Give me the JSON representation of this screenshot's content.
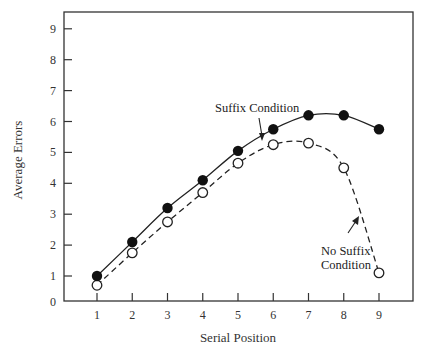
{
  "chart_data": {
    "type": "line",
    "title": "",
    "xlabel": "Serial Position",
    "ylabel": "Average Errors",
    "x": [
      1,
      2,
      3,
      4,
      5,
      6,
      7,
      8,
      9
    ],
    "xticks": [
      "1",
      "2",
      "3",
      "4",
      "5",
      "6",
      "7",
      "8",
      "9"
    ],
    "yticks": [
      "1",
      "2",
      "3",
      "4",
      "5",
      "6",
      "7",
      "8",
      "9"
    ],
    "origin_label": "0",
    "xlim": [
      0,
      9.9
    ],
    "ylim": [
      0,
      9.55
    ],
    "grid": false,
    "legend": "none (inline annotations with arrows)",
    "series": [
      {
        "name": "Suffix Condition",
        "marker": "filled-circle",
        "line": "solid",
        "values": [
          1.0,
          2.1,
          3.2,
          4.1,
          5.05,
          5.75,
          6.2,
          6.2,
          5.75
        ]
      },
      {
        "name": "No Suffix Condition",
        "marker": "open-circle",
        "line": "dashed",
        "values": [
          0.7,
          1.75,
          2.75,
          3.7,
          4.65,
          5.25,
          5.3,
          4.5,
          1.1
        ]
      }
    ],
    "annotations": [
      {
        "text": "Suffix Condition",
        "points_to": "Suffix Condition curve between positions 5 and 6"
      },
      {
        "text_lines": [
          "No Suffix",
          "Condition"
        ],
        "points_to": "No Suffix Condition curve between positions 8 and 9"
      }
    ]
  },
  "labels": {
    "xlabel": "Serial Position",
    "ylabel": "Average Errors",
    "origin": "0",
    "suffix_annotation": "Suffix Condition",
    "nosuffix_line1": "No Suffix",
    "nosuffix_line2": "Condition"
  }
}
